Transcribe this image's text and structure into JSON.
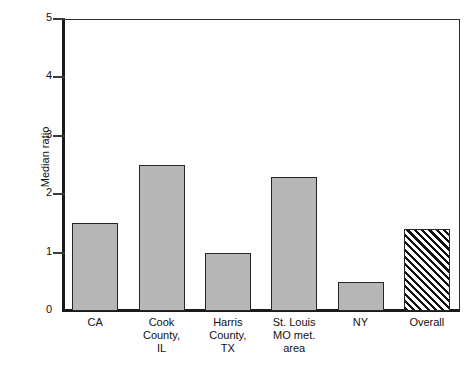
{
  "chart_data": {
    "type": "bar",
    "title": "",
    "xlabel": "",
    "ylabel": "Median ratio",
    "ylim": [
      0,
      5
    ],
    "yticks": [
      "0",
      "1",
      "2",
      "3",
      "4",
      "5"
    ],
    "grid": false,
    "legend": "none",
    "categories": [
      "CA",
      "Cook County, IL",
      "Harris County, TX",
      "St. Louis MO met. area",
      "NY",
      "Overall"
    ],
    "category_lines": [
      [
        "CA"
      ],
      [
        "Cook",
        "County,",
        "IL"
      ],
      [
        "Harris",
        "County,",
        "TX"
      ],
      [
        "St. Louis",
        "MO met.",
        "area"
      ],
      [
        "NY"
      ],
      [
        "Overall"
      ]
    ],
    "values": [
      1.5,
      2.5,
      1.0,
      2.3,
      0.5,
      1.4
    ],
    "bar_styles": [
      "solid",
      "solid",
      "solid",
      "solid",
      "solid",
      "hatched"
    ],
    "colors": {
      "bar_fill": "#b6b6b6",
      "bar_edge": "#262626",
      "hatch_line": "#111111",
      "axis": "#1a1a1a",
      "text": "#111111",
      "background": "#ffffff"
    }
  }
}
